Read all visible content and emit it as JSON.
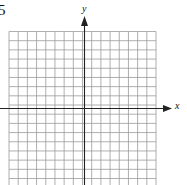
{
  "problem": {
    "number": "5"
  },
  "axes": {
    "x_label": "x",
    "y_label": "y"
  },
  "grid": {
    "columns": 16,
    "rows": 16,
    "line_color": "#9a9a9a",
    "axis_color": "#222222"
  }
}
